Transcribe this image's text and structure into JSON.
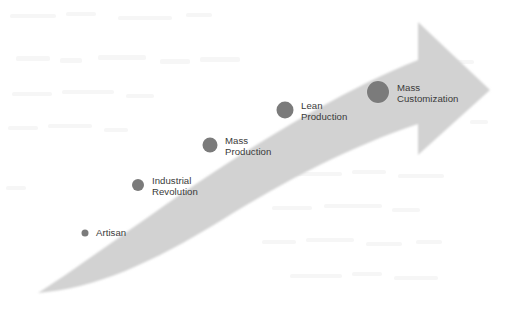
{
  "figure": {
    "width": 510,
    "height": 310,
    "background_color": "#ffffff"
  },
  "arrow": {
    "name": "progression-arrow",
    "description": "Curved arrow sweeping from lower-left to upper-right, tapered tail, triangular arrowhead",
    "fill_color": "#d2d2d2",
    "tail_tip": {
      "x": 38,
      "y": 293
    },
    "head_tip": {
      "x": 490,
      "y": 90
    },
    "head_barb_top_y": 22,
    "head_barb_bottom_y": 155
  },
  "chart_data": {
    "type": "line",
    "subtitle": "",
    "xlabel": "",
    "ylabel": "",
    "grid": false,
    "legend_position": "none",
    "annotations": [
      "Dot size increases left-to-right, encoding growing scale and complexity of each paradigm",
      "Arrow direction indicates forward progression through time"
    ],
    "categories": [
      "Artisan",
      "Industrial Revolution",
      "Mass Production",
      "Lean Production",
      "Mass Customization"
    ],
    "series": [
      {
        "name": "Manufacturing paradigm milestone",
        "marker_diameters_px": [
          7,
          12,
          15,
          17,
          22
        ],
        "x": [
          85,
          138,
          210,
          285,
          378
        ],
        "y": [
          233,
          185,
          145,
          110,
          92
        ]
      }
    ],
    "xlim": [
      0,
      510
    ],
    "ylim": [
      310,
      0
    ]
  },
  "milestones": [
    {
      "label": "Artisan",
      "label_lines": "Artisan",
      "dot_x": 85,
      "dot_y": 233,
      "dot_size": 7,
      "label_x": 96,
      "label_y": 233,
      "dot_color": "#7b7b7b",
      "label_color": "#3a3a3a"
    },
    {
      "label": "Industrial Revolution",
      "label_lines": "Industrial\nRevolution",
      "dot_x": 138,
      "dot_y": 185,
      "dot_size": 12,
      "label_x": 152,
      "label_y": 186,
      "dot_color": "#7b7b7b",
      "label_color": "#3a3a3a"
    },
    {
      "label": "Mass Production",
      "label_lines": "Mass\nProduction",
      "dot_x": 210,
      "dot_y": 145,
      "dot_size": 15,
      "label_x": 225,
      "label_y": 146,
      "dot_color": "#7b7b7b",
      "label_color": "#3a3a3a"
    },
    {
      "label": "Lean Production",
      "label_lines": "Lean\nProduction",
      "dot_x": 285,
      "dot_y": 110,
      "dot_size": 17,
      "label_x": 301,
      "label_y": 111,
      "dot_color": "#7b7b7b",
      "label_color": "#3a3a3a"
    },
    {
      "label": "Mass Customization",
      "label_lines": "Mass\nCustomization",
      "dot_x": 378,
      "dot_y": 92,
      "dot_size": 22,
      "label_x": 397,
      "label_y": 93,
      "dot_color": "#7b7b7b",
      "label_color": "#3a3a3a"
    }
  ]
}
